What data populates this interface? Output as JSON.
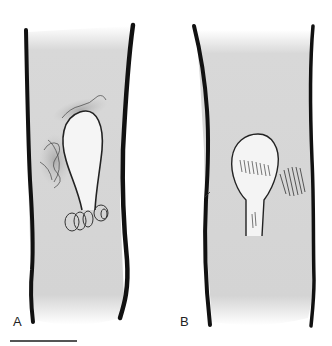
{
  "figure": {
    "panels": [
      {
        "label": "A",
        "description": "Tubular structure with ovoid cyst-like body on a stalk, surrounded by shaded irregular tissue and small looped structures at the base"
      },
      {
        "label": "B",
        "description": "Tubular structure with ovoid cyst-like body with hatched shading and a stalk, with hatched tissue adjacent to the right wall"
      }
    ],
    "scale_bar": {
      "visible": true,
      "label": ""
    },
    "colors": {
      "wall": "#111111",
      "lumen": "#d6d6d6",
      "cyst": "#f4f4f4",
      "background": "#ffffff"
    }
  }
}
